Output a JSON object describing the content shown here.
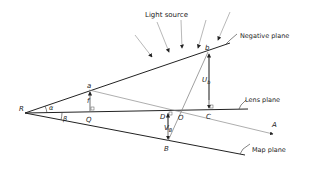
{
  "diagram": {
    "labels": {
      "light_source": "Light source",
      "negative_plane": "Negative plane",
      "lens_plane": "Lens plane",
      "map_plane": "Map plane"
    },
    "points": {
      "R": "R",
      "a": "a",
      "b": "b",
      "Q": "Q",
      "D": "D",
      "O": "O",
      "C": "C",
      "A": "A",
      "B": "B"
    },
    "symbols": {
      "alpha": "α",
      "beta": "β",
      "f": "f",
      "U_b_main": "U",
      "U_b_sub": "b",
      "V_B_main": "V",
      "V_B_sub": "B"
    },
    "colors": {
      "line": "#222222",
      "thin_line": "#888888",
      "background": "#ffffff"
    }
  }
}
